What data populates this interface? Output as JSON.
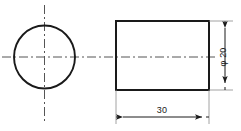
{
  "drawing": {
    "title": "Cylinder two-view orthographic drawing",
    "background_color": "#ffffff",
    "line_color": "#1a1a1a",
    "centerline_color": "#555555",
    "thin_line_color": "#888888",
    "views": {
      "end_view": {
        "name": "circle-end-view",
        "shape": "circle",
        "center_x": 44.5,
        "center_y": 57,
        "radius_x": 30.5,
        "radius_y": 31.5
      },
      "side_view": {
        "name": "rectangle-side-view",
        "shape": "rectangle",
        "x": 116,
        "y": 21,
        "width": 93,
        "height": 69
      }
    },
    "dimensions": {
      "diameter": {
        "label": "φ 20",
        "value": "20",
        "symbol": "φ",
        "orientation": "vertical",
        "line_x": 225,
        "top_y": 21,
        "bottom_y": 90,
        "text_x": 224,
        "text_y": 56
      },
      "length": {
        "label": "30",
        "value": "30",
        "orientation": "horizontal",
        "line_y": 117,
        "left_x": 116,
        "right_x": 209,
        "text_x": 162,
        "text_y": 112
      }
    },
    "centerlines": {
      "horizontal": {
        "name": "horizontal-centerline",
        "x1": 2,
        "x2": 216,
        "y": 57
      },
      "vertical": {
        "name": "vertical-centerline",
        "x": 44.5,
        "y1": 5,
        "y2": 122
      }
    }
  }
}
